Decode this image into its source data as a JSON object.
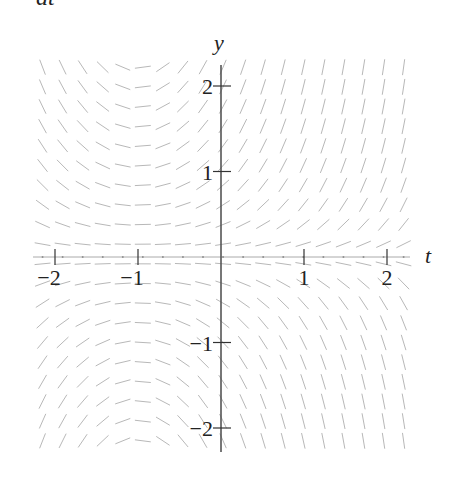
{
  "header_fragment": "dt",
  "chart_data": {
    "type": "slope_field",
    "equation": "dy/dt = (t + 1) y",
    "xlabel": "t",
    "ylabel": "y",
    "xlim": [
      -2.25,
      2.25
    ],
    "ylim": [
      -2.3,
      2.3
    ],
    "xticks": [
      -2,
      -1,
      1,
      2
    ],
    "xtick_labels": [
      "−2",
      "−1",
      "1",
      "2"
    ],
    "yticks": [
      2,
      1,
      -1,
      -2
    ],
    "ytick_labels": [
      "2",
      "1",
      "−1",
      "−2"
    ],
    "grid": false,
    "field_grid": {
      "t_start": -2.15,
      "t_end": 2.2,
      "cols": 19,
      "y_start": 2.22,
      "y_end": -2.15,
      "rows": 20
    },
    "colors": {
      "axis": "#555555",
      "segment": "#b8b8b8",
      "text": "#222222"
    }
  }
}
